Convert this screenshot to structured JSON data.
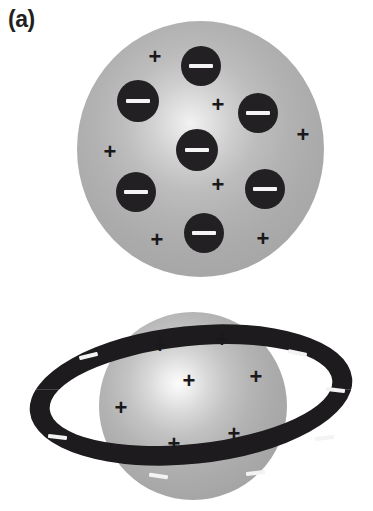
{
  "figure": {
    "background_color": "#ffffff",
    "panels": [
      {
        "id": "a",
        "label": "(a)",
        "caption_text": "(a)"
      },
      {
        "id": "b",
        "label": "(b)",
        "caption_text": "(b)"
      }
    ]
  },
  "colors": {
    "sphere_light": "#f2f2f2",
    "sphere_mid": "#b5b5b5",
    "sphere_dark": "#9e9e9e",
    "electron_fill": "#222022",
    "charge_mark": "#f4f4f4",
    "plus_color": "#1a181a",
    "ring_fill": "#1d1b1d",
    "page_background": "#ffffff"
  },
  "panel_a": {
    "label": "(a)",
    "sphere": {
      "cx": 200,
      "cy": 149,
      "rx": 123,
      "ry": 128
    },
    "electrons": [
      {
        "name": "electron-top-center",
        "cx": 201,
        "cy": 66,
        "r": 20,
        "symbol": "−"
      },
      {
        "name": "electron-upper-left",
        "cx": 138,
        "cy": 101,
        "r": 21,
        "symbol": "−"
      },
      {
        "name": "electron-upper-right",
        "cx": 258,
        "cy": 113,
        "r": 20,
        "symbol": "−"
      },
      {
        "name": "electron-center",
        "cx": 197,
        "cy": 150,
        "r": 21,
        "symbol": "−"
      },
      {
        "name": "electron-lower-left",
        "cx": 136,
        "cy": 192,
        "r": 20,
        "symbol": "−"
      },
      {
        "name": "electron-lower-right",
        "cx": 265,
        "cy": 189,
        "r": 20,
        "symbol": "−"
      },
      {
        "name": "electron-bottom",
        "cx": 204,
        "cy": 233,
        "r": 20,
        "symbol": "−"
      }
    ],
    "positive_charges": [
      {
        "name": "plus-upper-left",
        "cx": 155,
        "cy": 57,
        "symbol": "+"
      },
      {
        "name": "plus-mid-center",
        "cx": 218,
        "cy": 105,
        "symbol": "+"
      },
      {
        "name": "plus-mid-left",
        "cx": 110,
        "cy": 152,
        "symbol": "+"
      },
      {
        "name": "plus-far-right",
        "cx": 303,
        "cy": 135,
        "symbol": "+"
      },
      {
        "name": "plus-lower-center",
        "cx": 218,
        "cy": 185,
        "symbol": "+"
      },
      {
        "name": "plus-bottom-left",
        "cx": 157,
        "cy": 240,
        "symbol": "+"
      },
      {
        "name": "plus-bottom-right",
        "cx": 263,
        "cy": 239,
        "symbol": "+"
      }
    ]
  },
  "panel_b": {
    "label": "(b)",
    "sphere": {
      "cx": 193,
      "cy": 406,
      "rx": 94,
      "ry": 94
    },
    "ring": {
      "cx": 191,
      "cy": 395,
      "rx": 162,
      "ry": 69,
      "thickness": 20,
      "tilt_deg": -6
    },
    "positive_charges": [
      {
        "name": "plus-top-left",
        "cx": 160,
        "cy": 346,
        "symbol": "+"
      },
      {
        "name": "plus-top-right",
        "cx": 222,
        "cy": 340,
        "symbol": "+"
      },
      {
        "name": "plus-center",
        "cx": 189,
        "cy": 381,
        "symbol": "+"
      },
      {
        "name": "plus-mid-right",
        "cx": 256,
        "cy": 377,
        "symbol": "+"
      },
      {
        "name": "plus-mid-left",
        "cx": 121,
        "cy": 408,
        "symbol": "+"
      },
      {
        "name": "plus-lower-right",
        "cx": 234,
        "cy": 434,
        "symbol": "+"
      },
      {
        "name": "plus-lower-center",
        "cx": 174,
        "cy": 444,
        "symbol": "+"
      }
    ],
    "ring_charges": [
      {
        "name": "minus-ring-upper-left",
        "cx": 88,
        "cy": 356,
        "w": 19,
        "rot": -14,
        "symbol": "−"
      },
      {
        "name": "minus-ring-upper-right",
        "cx": 297,
        "cy": 353,
        "w": 19,
        "rot": 12,
        "symbol": "−"
      },
      {
        "name": "minus-ring-right",
        "cx": 335,
        "cy": 390,
        "w": 19,
        "rot": 6,
        "symbol": "−"
      },
      {
        "name": "minus-ring-left",
        "cx": 57,
        "cy": 437,
        "w": 19,
        "rot": 6,
        "symbol": "−"
      },
      {
        "name": "minus-ring-lower-right",
        "cx": 324,
        "cy": 438,
        "w": 19,
        "rot": -6,
        "symbol": "−"
      },
      {
        "name": "minus-ring-bottom-left",
        "cx": 158,
        "cy": 476,
        "w": 19,
        "rot": 8,
        "symbol": "−"
      },
      {
        "name": "minus-ring-bottom-right",
        "cx": 255,
        "cy": 473,
        "w": 19,
        "rot": -6,
        "symbol": "−"
      }
    ]
  }
}
